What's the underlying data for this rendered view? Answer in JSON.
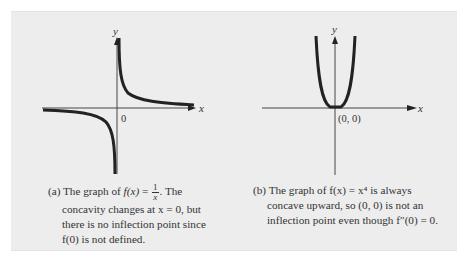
{
  "panel_a": {
    "y_label": "y",
    "x_label": "x",
    "origin_label": "0",
    "caption_prefix": "(a) The graph of ",
    "caption_fx": "f(x)",
    "caption_eq": " = ",
    "frac_num": "1",
    "frac_den": "x",
    "caption_after": ". The",
    "caption_line2": "concavity changes at x = 0, but",
    "caption_line3": "there is no inflection point since",
    "caption_line4": "f(0) is not defined."
  },
  "panel_b": {
    "y_label": "y",
    "x_label": "x",
    "point_label": "(0, 0)",
    "caption_line1": "(b) The graph of f(x) = x⁴ is always",
    "caption_line2": "concave upward, so (0, 0) is not an",
    "caption_line3": "inflection point even though f″(0) = 0."
  },
  "colors": {
    "panel_bg": "#ededed",
    "curve": "#222222",
    "axis": "#333333"
  }
}
